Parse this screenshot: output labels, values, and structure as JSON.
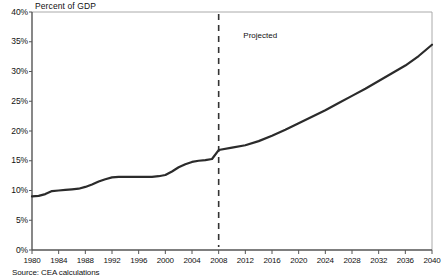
{
  "chart_data": {
    "type": "line",
    "title": "Percent of GDP",
    "xlabel": "",
    "ylabel": "Percent of GDP",
    "xlim": [
      1980,
      2040
    ],
    "ylim": [
      0,
      40
    ],
    "grid": false,
    "legend": null,
    "ytick_labels": [
      "0%",
      "5%",
      "10%",
      "15%",
      "20%",
      "25%",
      "30%",
      "35%",
      "40%"
    ],
    "ytick_values": [
      0,
      5,
      10,
      15,
      20,
      25,
      30,
      35,
      40
    ],
    "xtick_labels": [
      "1980",
      "1984",
      "1988",
      "1992",
      "1996",
      "2000",
      "2004",
      "2008",
      "2012",
      "2016",
      "2020",
      "2024",
      "2028",
      "2032",
      "2036",
      "2040"
    ],
    "xtick_values": [
      1980,
      1984,
      1988,
      1992,
      1996,
      2000,
      2004,
      2008,
      2012,
      2016,
      2020,
      2024,
      2028,
      2032,
      2036,
      2040
    ],
    "annotations": [
      {
        "text": "Projected",
        "x": 2012,
        "y": 36,
        "name": "projected-label"
      }
    ],
    "divider": {
      "x": 2008,
      "style": "dashed",
      "label": "Projected"
    },
    "series": [
      {
        "name": "Percent of GDP",
        "color": "#2b2b2b",
        "x": [
          1980,
          1981,
          1982,
          1983,
          1984,
          1985,
          1986,
          1987,
          1988,
          1989,
          1990,
          1991,
          1992,
          1993,
          1994,
          1995,
          1996,
          1997,
          1998,
          1999,
          2000,
          2001,
          2002,
          2003,
          2004,
          2005,
          2006,
          2007,
          2008,
          2010,
          2012,
          2014,
          2016,
          2018,
          2020,
          2022,
          2024,
          2026,
          2028,
          2030,
          2032,
          2034,
          2036,
          2038,
          2040
        ],
        "y": [
          9.0,
          9.1,
          9.4,
          9.9,
          10.0,
          10.1,
          10.2,
          10.3,
          10.6,
          11.0,
          11.5,
          11.9,
          12.2,
          12.3,
          12.3,
          12.3,
          12.3,
          12.3,
          12.3,
          12.4,
          12.6,
          13.2,
          13.9,
          14.4,
          14.8,
          15.0,
          15.1,
          15.3,
          16.8,
          17.2,
          17.6,
          18.3,
          19.2,
          20.2,
          21.3,
          22.4,
          23.5,
          24.7,
          25.9,
          27.1,
          28.4,
          29.7,
          31.0,
          32.6,
          34.5
        ]
      }
    ],
    "source": "Source: CEA calculations"
  },
  "geometry": {
    "plot_left": 32,
    "plot_right": 432,
    "plot_top": 12,
    "plot_bottom": 250
  }
}
